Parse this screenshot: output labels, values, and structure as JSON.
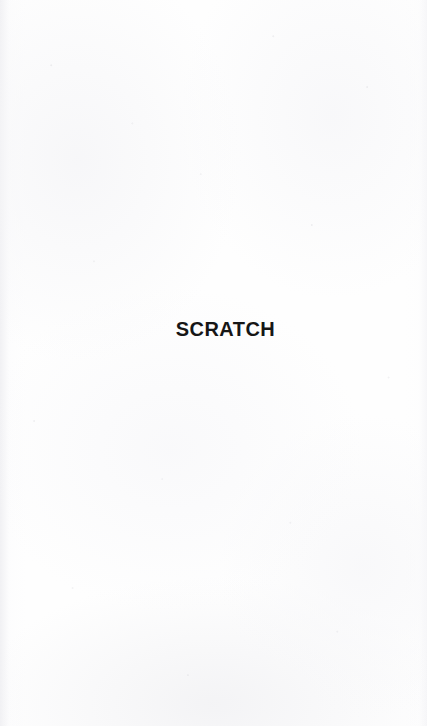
{
  "document": {
    "kind": "scanned-book-page",
    "page_width": 427,
    "page_height": 726,
    "background_color": "#fefefe",
    "ink_color": "#161616"
  },
  "page": {
    "heading": "SCRATCH",
    "body_text": "",
    "footer_text": "",
    "page_number": ""
  }
}
